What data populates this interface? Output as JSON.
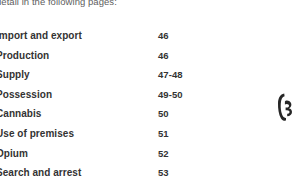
{
  "page": {
    "background_color": "#ffffff",
    "text_color": "#333333",
    "intro_text_color": "#5e5e5e"
  },
  "intro": {
    "text": "detail in the following pages:"
  },
  "contents": {
    "entries": [
      {
        "label": "Import and export",
        "pages": "46"
      },
      {
        "label": "Production",
        "pages": "46"
      },
      {
        "label": "Supply",
        "pages": "47-48"
      },
      {
        "label": "Possession",
        "pages": "49-50"
      },
      {
        "label": "Cannabis",
        "pages": "50"
      },
      {
        "label": "Use of premises",
        "pages": "51"
      },
      {
        "label": "Opium",
        "pages": "52"
      },
      {
        "label": "Search and arrest",
        "pages": "53"
      }
    ]
  },
  "artifact": {
    "name": "edge-ink-mark",
    "color": "#262626"
  }
}
